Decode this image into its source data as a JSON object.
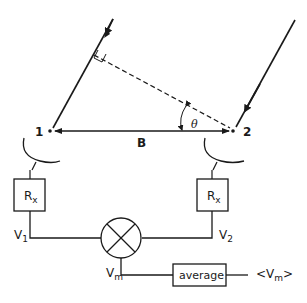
{
  "diagram": {
    "antennas": [
      {
        "id": "1",
        "label": "1"
      },
      {
        "id": "2",
        "label": "2"
      }
    ],
    "baseline_label": "B",
    "angle_label": "θ",
    "receivers": [
      {
        "label": "R",
        "subscript": "x"
      },
      {
        "label": "R",
        "subscript": "x"
      }
    ],
    "signals": {
      "v1": {
        "label": "V",
        "subscript": "1"
      },
      "v2": {
        "label": "V",
        "subscript": "2"
      },
      "vm": {
        "label": "V",
        "subscript": "m"
      }
    },
    "multiplier": {
      "symbol": "multiply"
    },
    "average_box": {
      "label": "average"
    },
    "output": {
      "prefix": "<V",
      "subscript": "m",
      "suffix": ">"
    },
    "colors": {
      "stroke": "#1a1a1a",
      "background": "#ffffff"
    }
  }
}
